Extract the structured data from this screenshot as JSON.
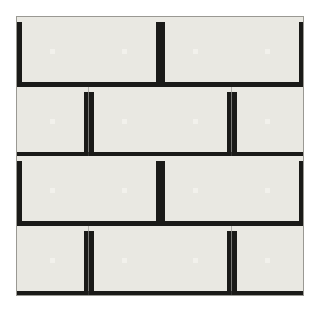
{
  "artwork": {
    "title": "Log Cabin Quilt",
    "pattern_name": "Log Cabin",
    "setting": "Straight Furrows / alternating light-dark checkerboard",
    "background_color": "#ffffff",
    "canvas": {
      "width": 321,
      "height": 314
    },
    "quilt_area": {
      "x": 16,
      "y": 16,
      "width": 288,
      "height": 280
    },
    "grid": {
      "rows": 4,
      "cols": 4,
      "block_width": 72,
      "block_height": 70
    }
  },
  "palette": {
    "center": "#f2f1ec",
    "light_1": "#e9e8e2",
    "light_2": "#d9d8d2",
    "light_3": "#c9c8c2",
    "light_4": "#bdbcb6",
    "light_5": "#a9a8a2",
    "mid_1": "#9d9c96",
    "mid_2": "#8b8a85",
    "mid_3": "#77766f",
    "dark_1": "#5e5d57",
    "dark_2": "#4a4944",
    "dark_3": "#3a3935",
    "dark_4": "#2b2a27",
    "dark_5": "#1a1a18",
    "outline": "#9a9993"
  },
  "block_types": {
    "A": {
      "name": "light-top-dark-bottom",
      "description": "Light logs run along the top and right of the center; dark logs run along the left and bottom."
    },
    "B": {
      "name": "dark-top-light-bottom",
      "description": "Mirror image of type A: dark logs along top and left; light logs along bottom and right."
    }
  },
  "blocks": [
    [
      "A",
      "B",
      "A",
      "B"
    ],
    [
      "B",
      "A",
      "B",
      "A"
    ],
    [
      "A",
      "B",
      "A",
      "B"
    ],
    [
      "B",
      "A",
      "B",
      "A"
    ]
  ],
  "rings": [
    {
      "ring": 1,
      "light": "light_1",
      "dark": "dark_5"
    },
    {
      "ring": 2,
      "light": "light_2",
      "dark": "dark_4"
    },
    {
      "ring": 3,
      "light": "light_3",
      "dark": "dark_3"
    },
    {
      "ring": 4,
      "light": "light_4",
      "dark": "dark_2"
    },
    {
      "ring": 5,
      "light": "light_5",
      "dark": "dark_1"
    },
    {
      "ring": 6,
      "light": "mid_1",
      "dark": "mid_3"
    },
    {
      "ring": 7,
      "light": "mid_2",
      "dark": "mid_2"
    }
  ]
}
